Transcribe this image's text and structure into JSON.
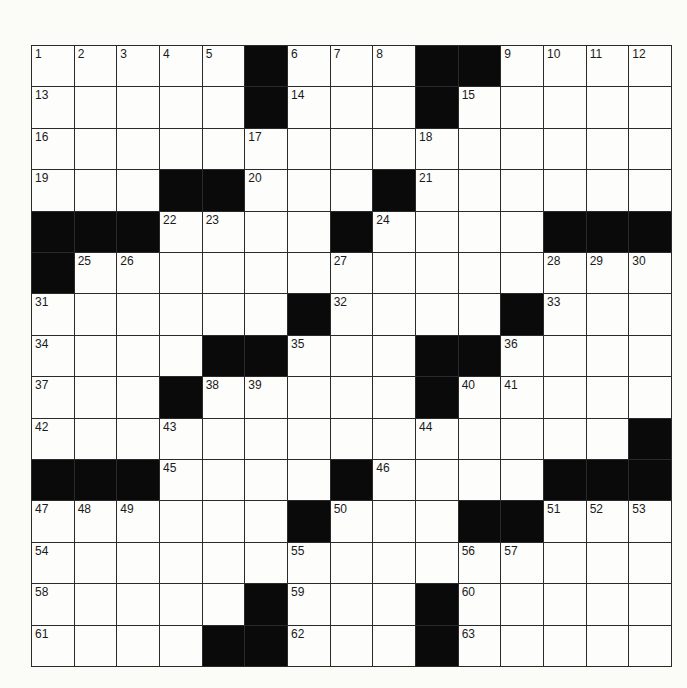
{
  "puzzle": {
    "size": {
      "rows": 15,
      "cols": 15
    },
    "colors": {
      "block": "#0a0a0a",
      "cell": "#fdfdfb",
      "line": "#2a2a2a"
    },
    "rows": [
      [
        "1",
        "2",
        "3",
        "4",
        "5",
        "#",
        "6",
        "7",
        "8",
        "#",
        "#",
        "9",
        "10",
        "11",
        "12"
      ],
      [
        "13",
        "",
        "",
        "",
        "",
        "#",
        "14",
        "",
        "",
        "#",
        "15",
        "",
        "",
        "",
        ""
      ],
      [
        "16",
        "",
        "",
        "",
        "",
        "17",
        "",
        "",
        "",
        "18",
        "",
        "",
        "",
        "",
        ""
      ],
      [
        "19",
        "",
        "",
        "#",
        "#",
        "20",
        "",
        "",
        "#",
        "21",
        "",
        "",
        "",
        "",
        ""
      ],
      [
        "#",
        "#",
        "#",
        "22",
        "23",
        "",
        "",
        "#",
        "24",
        "",
        "",
        "",
        "#",
        "#",
        "#"
      ],
      [
        "#",
        "25",
        "26",
        "",
        "",
        "",
        "",
        "27",
        "",
        "",
        "",
        "",
        "28",
        "29",
        "30"
      ],
      [
        "31",
        "",
        "",
        "",
        "",
        "",
        "#",
        "32",
        "",
        "",
        "",
        "#",
        "33",
        "",
        ""
      ],
      [
        "34",
        "",
        "",
        "",
        "#",
        "#",
        "35",
        "",
        "",
        "#",
        "#",
        "36",
        "",
        "",
        ""
      ],
      [
        "37",
        "",
        "",
        "#",
        "38",
        "39",
        "",
        "",
        "",
        "#",
        "40",
        "41",
        "",
        "",
        ""
      ],
      [
        "42",
        "",
        "",
        "43",
        "",
        "",
        "",
        "",
        "",
        "44",
        "",
        "",
        "",
        "",
        "#"
      ],
      [
        "#",
        "#",
        "#",
        "45",
        "",
        "",
        "",
        "#",
        "46",
        "",
        "",
        "",
        "#",
        "#",
        "#"
      ],
      [
        "47",
        "48",
        "49",
        "",
        "",
        "",
        "#",
        "50",
        "",
        "",
        "#",
        "#",
        "51",
        "52",
        "53"
      ],
      [
        "54",
        "",
        "",
        "",
        "",
        "",
        "55",
        "",
        "",
        "",
        "56",
        "57",
        "",
        "",
        ""
      ],
      [
        "58",
        "",
        "",
        "",
        "",
        "#",
        "59",
        "",
        "",
        "#",
        "60",
        "",
        "",
        "",
        ""
      ],
      [
        "61",
        "",
        "",
        "",
        "#",
        "#",
        "62",
        "",
        "",
        "#",
        "63",
        "",
        "",
        "",
        ""
      ]
    ],
    "letters": []
  }
}
